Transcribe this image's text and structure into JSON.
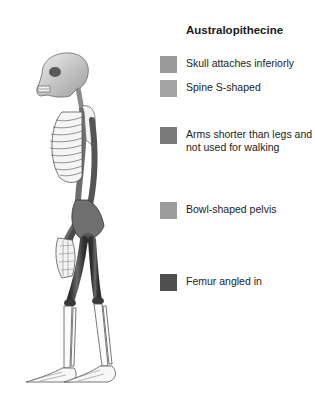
{
  "legend": {
    "title": "Australopithecine",
    "items": [
      {
        "label": "Skull attaches inferiorly",
        "color": "#9a9a9a",
        "top": 57
      },
      {
        "label": "Spine S-shaped",
        "color": "#a3a3a3",
        "top": 81
      },
      {
        "label": "Arms shorter than legs and not used for walking",
        "color": "#7a7a7a",
        "top": 128
      },
      {
        "label": "Bowl-shaped pelvis",
        "color": "#9c9c9c",
        "top": 203
      },
      {
        "label": "Femur angled in",
        "color": "#4f4f4f",
        "top": 275
      }
    ]
  },
  "figure": {
    "colors": {
      "bone": "#f4f4f4",
      "bone_outline": "#555555",
      "skull": "#d9d9d9",
      "spine": "#8a8a8a",
      "arm": "#6f6f6f",
      "pelvis": "#7d7d7d",
      "femur": "#3f3f3f"
    }
  }
}
